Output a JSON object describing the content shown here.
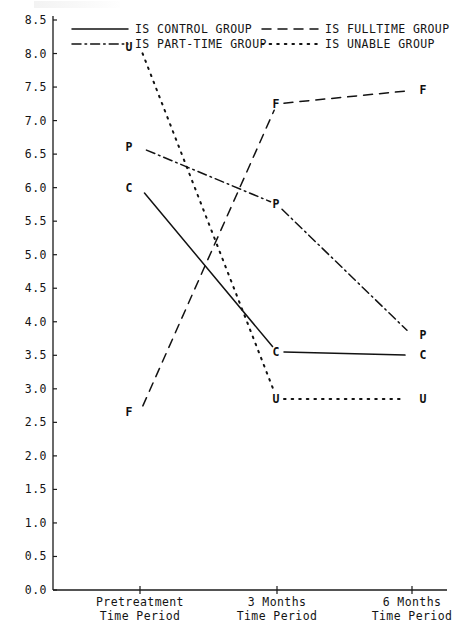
{
  "chart_data": {
    "type": "line",
    "title": "",
    "xlabel": "",
    "ylabel": "",
    "categories": [
      "Pretreatment Time Period",
      "3 Months Time Period",
      "6 Months Time Period"
    ],
    "x_tick_lines": [
      [
        "Pretreatment",
        "Time Period"
      ],
      [
        "3 Months",
        "Time Period"
      ],
      [
        "6 Months",
        "Time Period"
      ]
    ],
    "ylim": [
      0.0,
      8.5
    ],
    "ystep": 0.5,
    "ytick_labels": [
      "0.0",
      "0.5",
      "1.0",
      "1.5",
      "2.0",
      "2.5",
      "3.0",
      "3.5",
      "4.0",
      "4.5",
      "5.0",
      "5.5",
      "6.0",
      "6.5",
      "7.0",
      "7.5",
      "8.0",
      "8.5"
    ],
    "grid": false,
    "legend_position": "top",
    "series": [
      {
        "name": "IS CONTROL GROUP",
        "marker": "C",
        "style": "solid",
        "values": [
          6.0,
          3.55,
          3.5
        ]
      },
      {
        "name": "IS FULLTIME GROUP",
        "marker": "F",
        "style": "dashed",
        "values": [
          2.65,
          7.25,
          7.45
        ]
      },
      {
        "name": "IS PART-TIME GROUP",
        "marker": "P",
        "style": "dashdot",
        "values": [
          6.6,
          5.75,
          3.8
        ]
      },
      {
        "name": "IS UNABLE GROUP",
        "marker": "U",
        "style": "dotted",
        "values": [
          8.1,
          2.85,
          2.85
        ]
      }
    ]
  },
  "legend": {
    "entries": [
      {
        "label": "IS CONTROL GROUP",
        "style": "solid"
      },
      {
        "label": "IS FULLTIME GROUP",
        "style": "dashed"
      },
      {
        "label": "IS PART-TIME GROUP",
        "style": "dashdot"
      },
      {
        "label": "IS UNABLE GROUP",
        "style": "dotted"
      }
    ]
  },
  "colors": {
    "ink": "#121212",
    "paper": "#ffffff"
  }
}
